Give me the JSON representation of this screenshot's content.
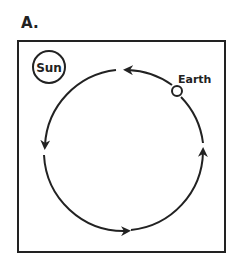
{
  "figure": {
    "panel_label": "A.",
    "sun_label": "Sun",
    "earth_label": "Earth",
    "colors": {
      "stroke": "#222222",
      "background": "#ffffff"
    }
  }
}
